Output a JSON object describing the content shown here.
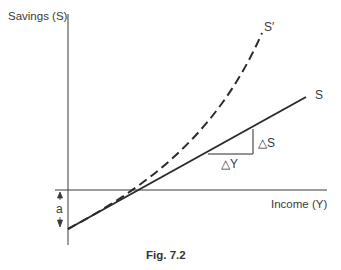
{
  "figure": {
    "caption": "Fig. 7.2",
    "y_axis_label": "Savings (S)",
    "x_axis_label": "Income (Y)",
    "intercept_label": "a",
    "curves": [
      {
        "name": "S",
        "label": "S",
        "style": "solid",
        "shape": "linear"
      },
      {
        "name": "S'",
        "label": "S′",
        "style": "dashed",
        "shape": "convex"
      }
    ],
    "slope_triangle": {
      "delta_s_label": "△S",
      "delta_y_label": "△Y"
    },
    "colors": {
      "line": "#2b2b2b",
      "axis": "#3a3a3a",
      "text": "#3a3a3a"
    }
  }
}
